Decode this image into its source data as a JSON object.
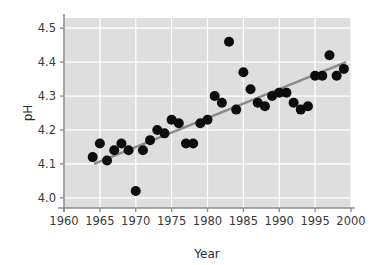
{
  "chart_data": {
    "type": "scatter",
    "title": "",
    "xlabel": "Year",
    "ylabel": "pH",
    "xlim": [
      1960,
      2000
    ],
    "ylim": [
      3.97,
      4.53
    ],
    "xticks": [
      1960,
      1965,
      1970,
      1975,
      1980,
      1985,
      1990,
      1995,
      2000
    ],
    "yticks": [
      4.0,
      4.1,
      4.2,
      4.3,
      4.4,
      4.5
    ],
    "xticklabels": [
      "1960",
      "1965",
      "1970",
      "1975",
      "1980",
      "1985",
      "1990",
      "1995",
      "2000"
    ],
    "yticklabels": [
      "4.0",
      "4.1",
      "4.2",
      "4.3",
      "4.4",
      "4.5"
    ],
    "grid": true,
    "grid_color": "#ffffff",
    "plot_background": "#dedede",
    "figure_background": "#ffffff",
    "marker_color": "#0d0d0d",
    "marker_size": 5,
    "legend": null,
    "series": [
      {
        "name": "pH",
        "x": [
          1964,
          1965,
          1966,
          1967,
          1968,
          1969,
          1970,
          1971,
          1972,
          1973,
          1974,
          1975,
          1976,
          1977,
          1978,
          1979,
          1980,
          1981,
          1982,
          1983,
          1984,
          1985,
          1986,
          1987,
          1988,
          1989,
          1990,
          1991,
          1992,
          1993,
          1994,
          1995,
          1996,
          1997,
          1998,
          1999
        ],
        "y": [
          4.12,
          4.16,
          4.11,
          4.14,
          4.16,
          4.14,
          4.02,
          4.14,
          4.17,
          4.2,
          4.19,
          4.23,
          4.22,
          4.16,
          4.16,
          4.22,
          4.23,
          4.3,
          4.28,
          4.46,
          4.26,
          4.37,
          4.32,
          4.28,
          4.27,
          4.3,
          4.31,
          4.31,
          4.28,
          4.26,
          4.27,
          4.36,
          4.36,
          4.42,
          4.36,
          4.38
        ]
      }
    ],
    "trendline": {
      "name": "least-squares fit",
      "color": "#8a8a8a",
      "width": 2.6,
      "x_start": 1964.2,
      "y_start": 4.1,
      "x_end": 1999.3,
      "y_end": 4.4
    }
  }
}
